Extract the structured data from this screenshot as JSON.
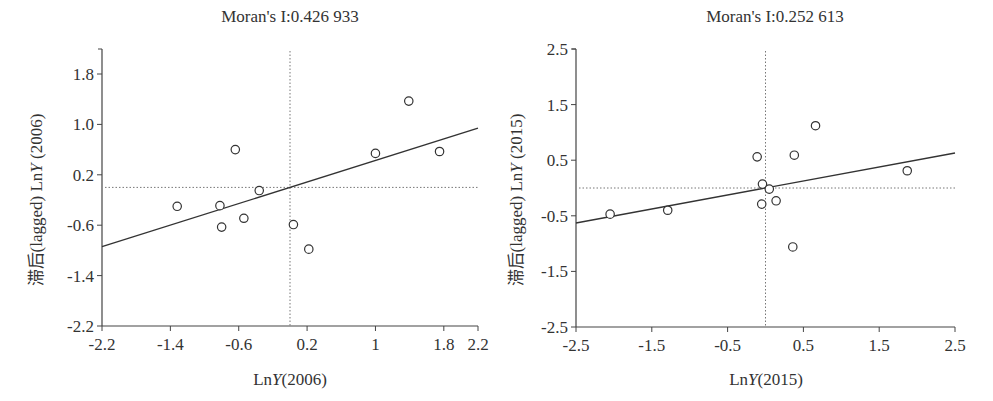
{
  "chart_data": [
    {
      "type": "scatter",
      "title": "Moran's I:0.426 933",
      "xlabel": "LnY(2006)",
      "ylabel": "滞后(lagged) LnY (2006)",
      "xlim": [
        -2.2,
        2.2
      ],
      "ylim": [
        -2.2,
        2.2
      ],
      "xticks": [
        "-2.2",
        "-1.4",
        "-0.6",
        "0.2",
        "1",
        "1.8",
        "2.2"
      ],
      "xtick_values": [
        -2.2,
        -1.4,
        -0.6,
        0.2,
        1.0,
        1.8,
        2.2
      ],
      "yticks": [
        "1.8",
        "1.0",
        "0.2",
        "-0.6",
        "-1.4",
        "-2.2"
      ],
      "ytick_values": [
        1.8,
        1.0,
        0.2,
        -0.6,
        -1.4,
        -2.2
      ],
      "grid": false,
      "reference_lines": {
        "x": 0.0,
        "y": 0.0,
        "style": "dotted"
      },
      "regression_line": {
        "slope": 0.426933,
        "x": [
          -2.2,
          2.2
        ],
        "y": [
          -0.94,
          0.94
        ]
      },
      "points": [
        {
          "x": -1.32,
          "y": -0.3
        },
        {
          "x": -0.82,
          "y": -0.29
        },
        {
          "x": -0.8,
          "y": -0.63
        },
        {
          "x": -0.64,
          "y": 0.6
        },
        {
          "x": -0.54,
          "y": -0.49
        },
        {
          "x": -0.36,
          "y": -0.05
        },
        {
          "x": 0.04,
          "y": -0.59
        },
        {
          "x": 0.22,
          "y": -0.98
        },
        {
          "x": 1.0,
          "y": 0.54
        },
        {
          "x": 1.39,
          "y": 1.37
        },
        {
          "x": 1.75,
          "y": 0.57
        }
      ]
    },
    {
      "type": "scatter",
      "title": "Moran's I:0.252 613",
      "xlabel": "LnY(2015)",
      "ylabel": "滞后(lagged) LnY (2015)",
      "xlim": [
        -2.5,
        2.5
      ],
      "ylim": [
        -2.5,
        2.5
      ],
      "xticks": [
        "-2.5",
        "-1.5",
        "-0.5",
        "0.5",
        "1.5",
        "2.5"
      ],
      "xtick_values": [
        -2.5,
        -1.5,
        -0.5,
        0.5,
        1.5,
        2.5
      ],
      "yticks": [
        "2.5",
        "1.5",
        "0.5",
        "-0.5",
        "-1.5",
        "-2.5"
      ],
      "ytick_values": [
        2.5,
        1.5,
        0.5,
        -0.5,
        -1.5,
        -2.5
      ],
      "grid": false,
      "reference_lines": {
        "x": 0.0,
        "y": 0.0,
        "style": "dotted"
      },
      "regression_line": {
        "slope": 0.252613,
        "x": [
          -2.5,
          2.5
        ],
        "y": [
          -0.63,
          0.63
        ]
      },
      "points": [
        {
          "x": -2.05,
          "y": -0.47
        },
        {
          "x": -1.29,
          "y": -0.4
        },
        {
          "x": -0.11,
          "y": 0.56
        },
        {
          "x": -0.04,
          "y": 0.07
        },
        {
          "x": 0.05,
          "y": -0.02
        },
        {
          "x": -0.05,
          "y": -0.29
        },
        {
          "x": 0.14,
          "y": -0.23
        },
        {
          "x": 0.38,
          "y": 0.59
        },
        {
          "x": 0.36,
          "y": -1.06
        },
        {
          "x": 0.66,
          "y": 1.12
        },
        {
          "x": 1.87,
          "y": 0.31
        }
      ]
    }
  ],
  "charts": {
    "left": {
      "title": "Moran's I:0.426 933",
      "xlabel_prefix": "Ln",
      "xlabel_var": "Y",
      "xlabel_suffix": "(2006)",
      "ylabel_cn": "滞后",
      "ylabel_rest": "(lagged) Ln",
      "ylabel_var": "Y",
      "ylabel_suffix": " (2006)"
    },
    "right": {
      "title": "Moran's I:0.252 613",
      "xlabel_prefix": "Ln",
      "xlabel_var": "Y",
      "xlabel_suffix": "(2015)",
      "ylabel_cn": "滞后",
      "ylabel_rest": "(lagged) Ln",
      "ylabel_var": "Y",
      "ylabel_suffix": " (2015)"
    }
  },
  "colors": {
    "axis": "#444444",
    "points_stroke": "#333333",
    "points_fill": "#ffffff",
    "regression": "#333333",
    "reference": "#777777"
  }
}
